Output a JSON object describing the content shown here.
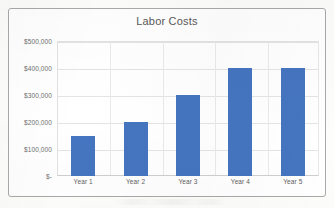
{
  "chart_data": {
    "type": "bar",
    "title": "Labor Costs",
    "xlabel": "",
    "ylabel": "",
    "categories": [
      "Year 1",
      "Year 2",
      "Year 3",
      "Year 4",
      "Year 5"
    ],
    "values": [
      150000,
      200000,
      300000,
      400000,
      400000
    ],
    "ylim": [
      0,
      500000
    ],
    "y_tick_values": [
      0,
      100000,
      200000,
      300000,
      400000,
      500000
    ],
    "y_tick_labels": [
      "$-",
      "$100,000",
      "$200,000",
      "$300,000",
      "$400,000",
      "$500,000"
    ],
    "grid": true,
    "legend": false,
    "legend_position": "none",
    "series": [
      {
        "name": "Labor Costs",
        "color": "#4575C0",
        "values": [
          150000,
          200000,
          300000,
          400000,
          400000
        ]
      }
    ]
  },
  "style": {
    "bar_color": "#4575C0",
    "title_color": "#585858",
    "tick_color": "#6E6E6E",
    "gridline_color": "#E4E4E4",
    "frame_color": "#A9A9A9",
    "plot_background": "#FFFFFF",
    "page_background": "#FDFDFC"
  }
}
